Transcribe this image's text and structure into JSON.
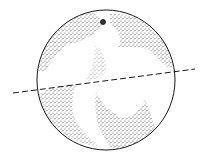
{
  "figure": {
    "colors": {
      "background": "#ffffff",
      "ink": "#1a1a1a",
      "stipple": "#2a2a2a"
    },
    "sphere": {
      "cx": 106,
      "cy": 80,
      "rx": 69,
      "ry": 70
    },
    "dashed_line": {
      "x1": 13,
      "y1": 93,
      "x2": 195,
      "y2": 69
    },
    "stem": {
      "cx": 103,
      "cy": 22,
      "r": 2.5
    }
  }
}
